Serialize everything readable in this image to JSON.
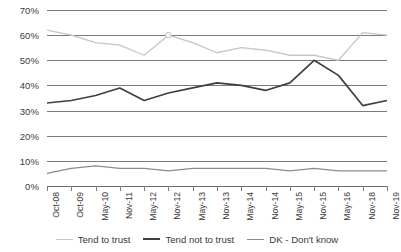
{
  "chart_data": {
    "type": "line",
    "title": "",
    "xlabel": "",
    "ylabel": "",
    "ylim": [
      0,
      70
    ],
    "ytick_labels": [
      "70%",
      "60%",
      "50%",
      "40%",
      "30%",
      "20%",
      "10%",
      "0%"
    ],
    "ytick_values": [
      70,
      60,
      50,
      40,
      30,
      20,
      10,
      0
    ],
    "grid": true,
    "legend_position": "bottom-center",
    "categories": [
      "Oct-08",
      "Oct-09",
      "May-10",
      "Nov-11",
      "May-12",
      "Nov-12",
      "May-13",
      "Nov-13",
      "May-14",
      "Nov-14",
      "May-15",
      "Nov-15",
      "May-16",
      "Nov-18",
      "Nov-19"
    ],
    "series": [
      {
        "name": "Tend to trust",
        "color": "#c6c6c6",
        "values": [
          62,
          60,
          57,
          56,
          52,
          60,
          57,
          53,
          55,
          54,
          52,
          52,
          50,
          61,
          60
        ]
      },
      {
        "name": "Tend not to trust",
        "color": "#3f3f3f",
        "values": [
          33,
          34,
          36,
          39,
          34,
          37,
          39,
          41,
          40,
          38,
          41,
          50,
          44,
          32,
          34
        ]
      },
      {
        "name": "DK - Don't know",
        "color": "#8c8c8c",
        "values": [
          5,
          7,
          8,
          7,
          7,
          6,
          7,
          7,
          7,
          7,
          6,
          7,
          6,
          6,
          6
        ]
      }
    ]
  },
  "legend": {
    "items": [
      {
        "label": "Tend to trust",
        "color": "#c6c6c6"
      },
      {
        "label": "Tend not to trust",
        "color": "#3f3f3f"
      },
      {
        "label": "DK - Don't know",
        "color": "#8c8c8c"
      }
    ]
  }
}
